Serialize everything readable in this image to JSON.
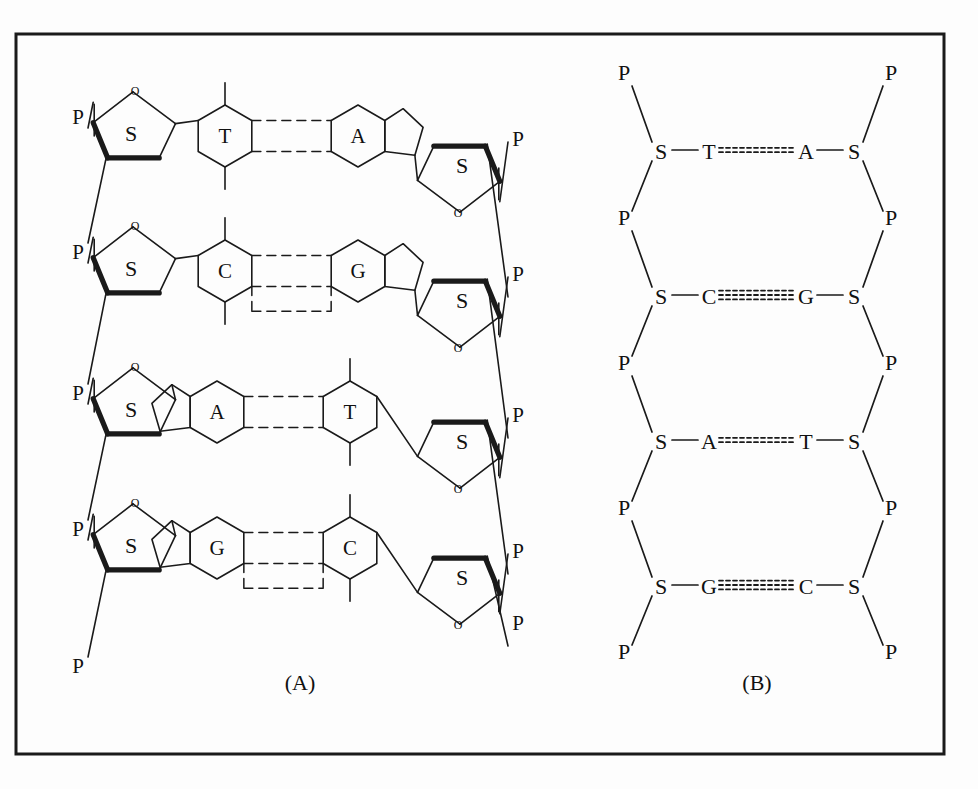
{
  "figure": {
    "background_color": "#fdfdfd",
    "stroke_color": "#1a1a1a",
    "border": {
      "x": 16,
      "y": 34,
      "width": 928,
      "height": 720,
      "stroke_width": 3
    }
  },
  "panels": [
    {
      "id": "A",
      "caption": "(A)",
      "caption_x": 300,
      "caption_y": 690
    },
    {
      "id": "B",
      "caption": "(B)",
      "caption_x": 757,
      "caption_y": 690
    }
  ],
  "panel_a": {
    "label": "(A)",
    "sugar_label": "S",
    "oxygen_label": "O",
    "phosphate_label": "P",
    "rungs": [
      {
        "left_base": "T",
        "right_base": "A",
        "left_type": "pyrimidine",
        "right_type": "purine",
        "hydrogen_bonds": 2,
        "y": 136
      },
      {
        "left_base": "C",
        "right_base": "G",
        "left_type": "pyrimidine",
        "right_type": "purine",
        "hydrogen_bonds": 3,
        "y": 271
      },
      {
        "left_base": "A",
        "right_base": "T",
        "left_type": "purine",
        "right_type": "pyrimidine",
        "hydrogen_bonds": 2,
        "y": 412
      },
      {
        "left_base": "G",
        "right_base": "C",
        "left_type": "purine",
        "right_type": "pyrimidine",
        "hydrogen_bonds": 3,
        "y": 548
      }
    ],
    "left_phosphates": [
      "P",
      "P",
      "P",
      "P",
      "P"
    ],
    "right_phosphates": [
      "P",
      "P",
      "P",
      "P",
      "P"
    ]
  },
  "panel_b": {
    "label": "(B)",
    "sugar_label": "S",
    "phosphate_label": "P",
    "rungs": [
      {
        "left_base": "T",
        "right_base": "A",
        "hydrogen_bonds": 2,
        "y": 152
      },
      {
        "left_base": "C",
        "right_base": "G",
        "hydrogen_bonds": 3,
        "y": 297
      },
      {
        "left_base": "A",
        "right_base": "T",
        "hydrogen_bonds": 2,
        "y": 442
      },
      {
        "left_base": "G",
        "right_base": "C",
        "hydrogen_bonds": 3,
        "y": 587
      }
    ],
    "left_phosphates": [
      "P",
      "P",
      "P",
      "P",
      "P"
    ],
    "right_phosphates": [
      "P",
      "P",
      "P",
      "P",
      "P"
    ],
    "left_sugar_x": 661,
    "right_sugar_x": 854,
    "left_p_x": 624,
    "right_p_x": 891
  }
}
